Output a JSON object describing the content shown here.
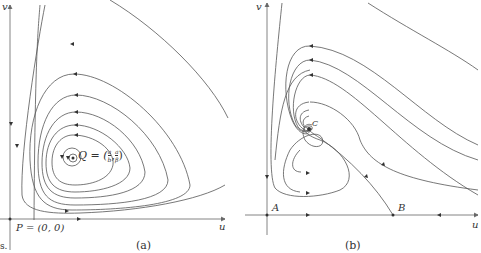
{
  "figure": {
    "panels": [
      {
        "id": "a",
        "caption": "(a)",
        "axis_x_label": "u",
        "axis_y_label": "v",
        "origin_label": "P = (0, 0)",
        "center_label": "Q = (a/b, a/β)",
        "center_label_display": "Q = (",
        "center_frac1_num": "a",
        "center_frac1_den": "b",
        "center_frac2_num": "a",
        "center_frac2_den": "β",
        "description": "closed orbits (centre) around Q, counter-clockwise"
      },
      {
        "id": "b",
        "caption": "(b)",
        "axis_x_label": "u",
        "axis_y_label": "v",
        "point_A": "A",
        "point_B": "B",
        "point_C": "C",
        "description": "trajectories spiraling into stable focus C; saddle at B"
      }
    ],
    "left_fragment": "s."
  },
  "colors": {
    "line": "#555555",
    "text": "#333333",
    "background": "#ffffff"
  }
}
